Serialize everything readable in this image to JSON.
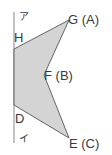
{
  "diagram": {
    "line": {
      "x": 14,
      "y1": 12,
      "y2": 143,
      "color": "#9a9a9a"
    },
    "polygon": {
      "fill": "#d4d4d4",
      "stroke": "#555555",
      "vertices": {
        "H": [
          14,
          49
        ],
        "G": [
          69,
          20
        ],
        "F": [
          44,
          75
        ],
        "E": [
          69,
          138
        ],
        "D": [
          14,
          105
        ]
      }
    },
    "labels": {
      "a": "ア",
      "i": "イ",
      "H": "H",
      "G": "G (A)",
      "F": "F (B)",
      "D": "D",
      "E": "E (C)"
    }
  }
}
